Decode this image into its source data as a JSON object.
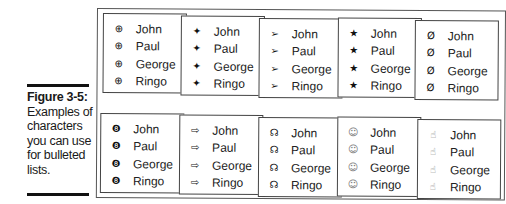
{
  "caption": {
    "figure_label": "Figure 3-5:",
    "text": "Examples of characters you can use for bulleted lists."
  },
  "names": [
    "John",
    "Paul",
    "George",
    "Ringo"
  ],
  "panels": [
    {
      "bullet": "⊕",
      "bullet_name": "circled-cross-icon"
    },
    {
      "bullet": "✦",
      "bullet_name": "four-point-star-icon"
    },
    {
      "bullet": "➢",
      "bullet_name": "arrowhead-icon"
    },
    {
      "bullet": "★",
      "bullet_name": "star-icon"
    },
    {
      "bullet": "Ø",
      "bullet_name": "crossed-loop-icon"
    },
    {
      "bullet": "❽",
      "bullet_name": "dark-circle-icon"
    },
    {
      "bullet": "⇨",
      "bullet_name": "outline-arrow-icon"
    },
    {
      "bullet": "☊",
      "bullet_name": "headphones-icon"
    },
    {
      "bullet": "☺",
      "bullet_name": "smiley-icon"
    },
    {
      "bullet": "☝",
      "bullet_name": "hand-icon"
    }
  ]
}
